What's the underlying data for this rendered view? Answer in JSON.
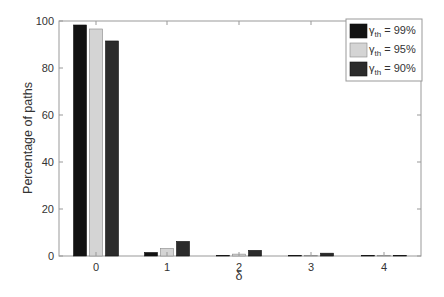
{
  "chart_data": {
    "type": "bar",
    "title": "",
    "xlabel": "δ",
    "ylabel": "Percentage of paths",
    "categories": [
      "0",
      "1",
      "2",
      "3",
      "4"
    ],
    "series": [
      {
        "name": "γth = 99%",
        "label_main": "γ",
        "label_sub": "th",
        "label_rest": " = 99%",
        "color": "#121212",
        "values": [
          98.3,
          1.5,
          0.2,
          0.0,
          0.0
        ]
      },
      {
        "name": "γth = 95%",
        "label_main": "γ",
        "label_sub": "th",
        "label_rest": " = 95%",
        "color": "#d4d4d4",
        "values": [
          96.6,
          3.2,
          0.8,
          0.1,
          0.0
        ]
      },
      {
        "name": "γth = 90%",
        "label_main": "γ",
        "label_sub": "th",
        "label_rest": " = 90%",
        "color": "#2b2b2b",
        "values": [
          91.5,
          6.2,
          2.4,
          1.2,
          0.1
        ]
      }
    ],
    "ylim": [
      0,
      100
    ],
    "yticks": [
      0,
      20,
      40,
      60,
      80,
      100
    ],
    "xticks": [
      0,
      1,
      2,
      3,
      4
    ],
    "grid": false,
    "legend_position": "upper right"
  }
}
